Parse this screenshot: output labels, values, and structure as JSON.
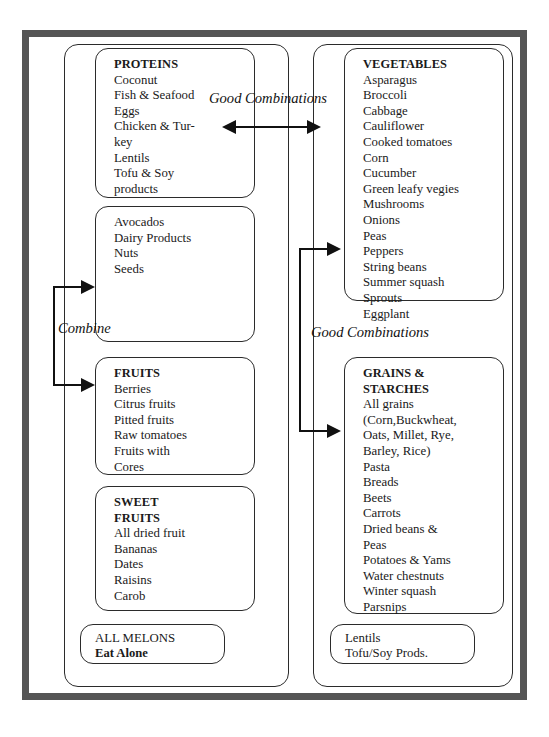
{
  "diagram": {
    "columns": {
      "left": {
        "boxes": [
          {
            "name": "proteins",
            "header": "PROTEINS",
            "items": [
              "Coconut",
              "Fish & Seafood",
              "Eggs",
              "Chicken & Tur-",
              "key",
              "Lentils",
              "Tofu & Soy",
              "products"
            ]
          },
          {
            "name": "fats",
            "header": "",
            "items": [
              "Avocados",
              "Dairy Products",
              "Nuts",
              "Seeds"
            ]
          },
          {
            "name": "fruits",
            "header": "FRUITS",
            "items": [
              "Berries",
              "Citrus fruits",
              "Pitted fruits",
              "Raw tomatoes",
              "Fruits with",
              "Cores"
            ]
          },
          {
            "name": "sweet-fruits",
            "header_line1": "SWEET",
            "header_line2": "FRUITS",
            "items": [
              "All dried fruit",
              "Bananas",
              "Dates",
              "Raisins",
              "Carob"
            ]
          },
          {
            "name": "melons",
            "line1": "ALL MELONS",
            "line2": "Eat Alone"
          }
        ]
      },
      "right": {
        "boxes": [
          {
            "name": "vegetables",
            "header": "VEGETABLES",
            "items": [
              "Asparagus",
              "Broccoli",
              "Cabbage",
              "Cauliflower",
              "Cooked tomatoes",
              "Corn",
              "Cucumber",
              "Green leafy vegies",
              "Mushrooms",
              "Onions",
              "Peas",
              "Peppers",
              "String beans",
              "Summer squash",
              "Sprouts",
              "Eggplant"
            ]
          },
          {
            "name": "grains-starches",
            "header_line1": "GRAINS &",
            "header_line2": "STARCHES",
            "items": [
              "All grains",
              "(Corn,Buckwheat,",
              "Oats, Millet, Rye,",
              "Barley, Rice)",
              "Pasta",
              "Breads",
              "Beets",
              "Carrots",
              "Dried beans &",
              "Peas",
              "Potatoes & Yams",
              "Water chestnuts",
              "Winter squash",
              "Parsnips"
            ]
          },
          {
            "name": "legumes",
            "items": [
              "Lentils",
              "Tofu/Soy Prods."
            ]
          }
        ]
      }
    },
    "labels": {
      "good_combinations_top": "Good Combinations",
      "combine": "Combine",
      "good_combinations_bottom": "Good Combinations"
    },
    "colors": {
      "ink": "#1a1a1a",
      "frame": "#555555",
      "background": "#ffffff"
    }
  }
}
